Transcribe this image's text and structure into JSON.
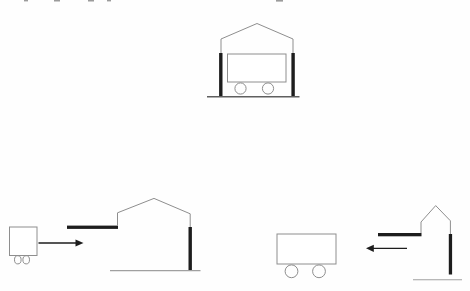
{
  "canvas": {
    "width": 470,
    "height": 291,
    "background": "#fefefe"
  },
  "colors": {
    "outline": "#8e8e8e",
    "dark": "#1d1d1d",
    "ground": "#5f5f5f",
    "ground_light": "#a0a0a0",
    "white": "#ffffff",
    "fragment": "#9b9b9b"
  },
  "figures": [
    {
      "name": "panel-garage-with-cart-inside",
      "shapes": [
        {
          "kind": "polyline",
          "name": "garage-roof-outline",
          "points": "221,39 257,23.5 293,39",
          "stroke": "outline",
          "sw": 1
        },
        {
          "kind": "line",
          "name": "garage-left-wall",
          "x1": 221,
          "y1": 39,
          "x2": 221,
          "y2": 53.5,
          "stroke": "outline",
          "sw": 1
        },
        {
          "kind": "line",
          "name": "garage-right-wall",
          "x1": 293,
          "y1": 39,
          "x2": 293,
          "y2": 53.5,
          "stroke": "outline",
          "sw": 1
        },
        {
          "kind": "rect",
          "name": "garage-left-door-closed-bar",
          "x": 219.1,
          "y": 53,
          "w": 3.4,
          "h": 43.5,
          "fill": "dark"
        },
        {
          "kind": "rect",
          "name": "garage-right-door-closed-bar",
          "x": 291.4,
          "y": 53,
          "w": 3.4,
          "h": 43.5,
          "fill": "dark"
        },
        {
          "kind": "rect",
          "name": "cart-body",
          "x": 227.5,
          "y": 54,
          "w": 58.5,
          "h": 28,
          "stroke": "outline",
          "sw": 1,
          "fill": "white"
        },
        {
          "kind": "circle",
          "name": "cart-wheel-left",
          "cx": 240.5,
          "cy": 88.5,
          "r": 5.6,
          "stroke": "outline",
          "sw": 1
        },
        {
          "kind": "circle",
          "name": "cart-wheel-right",
          "cx": 268,
          "cy": 88.5,
          "r": 5.6,
          "stroke": "outline",
          "sw": 1
        },
        {
          "kind": "line",
          "name": "ground-line",
          "x1": 207,
          "y1": 96.8,
          "x2": 299.5,
          "y2": 96.8,
          "stroke": "ground",
          "sw": 1.4
        }
      ]
    },
    {
      "name": "panel-cart-approaching-garage",
      "shapes": [
        {
          "kind": "rect",
          "name": "cart-body",
          "x": 9.5,
          "y": 227,
          "w": 27.5,
          "h": 28.5,
          "stroke": "outline",
          "sw": 1,
          "fill": "white"
        },
        {
          "kind": "ellipse",
          "name": "cart-wheel-left",
          "cx": 17.8,
          "cy": 259.8,
          "rx": 3.3,
          "ry": 4.1,
          "stroke": "outline",
          "sw": 1
        },
        {
          "kind": "ellipse",
          "name": "cart-wheel-right",
          "cx": 26.2,
          "cy": 259.8,
          "rx": 3.3,
          "ry": 4.1,
          "stroke": "outline",
          "sw": 1
        },
        {
          "kind": "line",
          "name": "velocity-arrow-shaft",
          "x1": 38.5,
          "y1": 243,
          "x2": 76,
          "y2": 243,
          "stroke": "dark",
          "sw": 1.3
        },
        {
          "kind": "polygon",
          "name": "velocity-arrow-head",
          "points": "75.5,239.4 83.5,243 75.5,246.6",
          "fill": "dark"
        },
        {
          "kind": "rect",
          "name": "garage-front-door-open-bar",
          "x": 67,
          "y": 225.6,
          "w": 51,
          "h": 3.3,
          "fill": "dark"
        },
        {
          "kind": "polyline",
          "name": "garage-outline",
          "points": "117.5,225.6 117.5,212.8 154,198.4 190.2,213.8 190.2,227.3",
          "stroke": "outline",
          "sw": 1
        },
        {
          "kind": "rect",
          "name": "garage-back-door-closed-bar",
          "x": 188.5,
          "y": 227,
          "w": 3.4,
          "h": 43.2,
          "fill": "dark"
        },
        {
          "kind": "line",
          "name": "ground-line",
          "x1": 110,
          "y1": 270.7,
          "x2": 200.5,
          "y2": 270.7,
          "stroke": "ground_light",
          "sw": 1.2
        }
      ]
    },
    {
      "name": "panel-garage-approaching-cart",
      "shapes": [
        {
          "kind": "rect",
          "name": "cart-body",
          "x": 277,
          "y": 234,
          "w": 59,
          "h": 30,
          "stroke": "outline",
          "sw": 1,
          "fill": "white"
        },
        {
          "kind": "circle",
          "name": "cart-wheel-left",
          "cx": 291.5,
          "cy": 271.3,
          "r": 6.4,
          "stroke": "outline",
          "sw": 1
        },
        {
          "kind": "circle",
          "name": "cart-wheel-right",
          "cx": 319,
          "cy": 271.3,
          "r": 6.4,
          "stroke": "outline",
          "sw": 1
        },
        {
          "kind": "line",
          "name": "velocity-arrow-shaft",
          "x1": 407,
          "y1": 248.3,
          "x2": 373,
          "y2": 248.3,
          "stroke": "dark",
          "sw": 1.3
        },
        {
          "kind": "polygon",
          "name": "velocity-arrow-head",
          "points": "373.8,244.7 366,248.3 373.8,251.9",
          "fill": "dark"
        },
        {
          "kind": "rect",
          "name": "garage-front-door-open-bar",
          "x": 378,
          "y": 233,
          "w": 43.5,
          "h": 3.3,
          "fill": "dark"
        },
        {
          "kind": "polyline",
          "name": "garage-outline",
          "points": "421,233 421,222 435.7,205.6 450.4,220.8 450.4,234.3",
          "stroke": "outline",
          "sw": 1
        },
        {
          "kind": "rect",
          "name": "garage-back-door-closed-bar",
          "x": 448.8,
          "y": 234,
          "w": 3.3,
          "h": 40.5,
          "fill": "dark"
        },
        {
          "kind": "line",
          "name": "ground-line",
          "x1": 413,
          "y1": 279.7,
          "x2": 462,
          "y2": 279.7,
          "stroke": "ground_light",
          "sw": 1.1
        }
      ]
    }
  ],
  "text_fragments": [
    {
      "x": 24,
      "y": 0,
      "w": 4,
      "h": 1.4
    },
    {
      "x": 54,
      "y": 0,
      "w": 6,
      "h": 1.5
    },
    {
      "x": 88,
      "y": 0,
      "w": 6,
      "h": 1.5
    },
    {
      "x": 107,
      "y": 0,
      "w": 4,
      "h": 1.4
    },
    {
      "x": 276,
      "y": 0,
      "w": 7,
      "h": 1.6
    }
  ]
}
